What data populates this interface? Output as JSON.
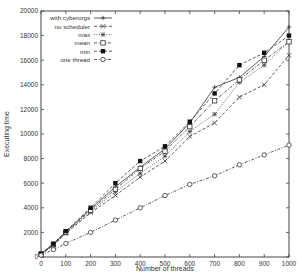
{
  "chart_data": {
    "type": "line",
    "title": "",
    "xlabel": "Number of threads",
    "ylabel": "Executing time",
    "xlim": [
      0,
      1000
    ],
    "ylim": [
      0,
      20000
    ],
    "xticks": [
      0,
      100,
      200,
      300,
      400,
      500,
      600,
      700,
      800,
      900,
      1000
    ],
    "yticks": [
      0,
      2000,
      4000,
      6000,
      8000,
      10000,
      12000,
      14000,
      16000,
      18000,
      20000
    ],
    "grid": false,
    "legend_position": "upper-left",
    "x": [
      0,
      50,
      100,
      200,
      300,
      400,
      500,
      600,
      700,
      800,
      900,
      1000
    ],
    "series": [
      {
        "name": "with cyberorgs",
        "marker": "plus",
        "dash": "solid",
        "values": [
          250,
          1050,
          2050,
          3900,
          5700,
          7300,
          8800,
          10900,
          13800,
          14600,
          16300,
          18700
        ]
      },
      {
        "name": "no scheduler",
        "marker": "cross",
        "dash": "dashed",
        "values": [
          200,
          950,
          1900,
          3600,
          5000,
          6500,
          7800,
          9800,
          10900,
          13000,
          14000,
          16400
        ]
      },
      {
        "name": "max",
        "marker": "asterisk",
        "dash": "dotted",
        "values": [
          220,
          1000,
          1950,
          3700,
          5300,
          6800,
          8200,
          10200,
          11600,
          14200,
          15600,
          17500
        ]
      },
      {
        "name": "mean",
        "marker": "square-open",
        "dash": "dashdot",
        "values": [
          240,
          1020,
          2000,
          3800,
          5500,
          7200,
          8600,
          10600,
          12700,
          14400,
          16000,
          17500
        ]
      },
      {
        "name": "min",
        "marker": "square-filled",
        "dash": "dashed",
        "values": [
          260,
          1080,
          2100,
          4000,
          6000,
          7800,
          9000,
          11000,
          13300,
          15600,
          16600,
          18000
        ]
      },
      {
        "name": "one thread",
        "marker": "circle-open",
        "dash": "dashdot",
        "values": [
          150,
          600,
          1100,
          2000,
          3000,
          4000,
          5000,
          5900,
          6600,
          7500,
          8300,
          9100
        ]
      }
    ]
  }
}
